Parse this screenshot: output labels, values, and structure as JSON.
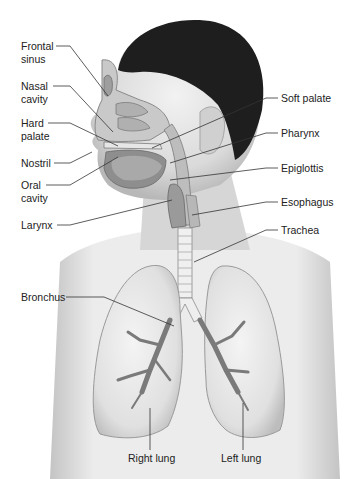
{
  "diagram": {
    "labels_left": [
      {
        "id": "frontal-sinus",
        "line1": "Frontal",
        "line2": "sinus"
      },
      {
        "id": "nasal-cavity",
        "line1": "Nasal",
        "line2": "cavity"
      },
      {
        "id": "hard-palate",
        "line1": "Hard",
        "line2": "palate"
      },
      {
        "id": "nostril",
        "line1": "Nostril",
        "line2": ""
      },
      {
        "id": "oral-cavity",
        "line1": "Oral",
        "line2": "cavity"
      },
      {
        "id": "larynx",
        "line1": "Larynx",
        "line2": ""
      },
      {
        "id": "bronchus",
        "line1": "Bronchus",
        "line2": ""
      }
    ],
    "labels_right": [
      {
        "id": "soft-palate",
        "text": "Soft palate"
      },
      {
        "id": "pharynx",
        "text": "Pharynx"
      },
      {
        "id": "epiglottis",
        "text": "Epiglottis"
      },
      {
        "id": "esophagus",
        "text": "Esophagus"
      },
      {
        "id": "trachea",
        "text": "Trachea"
      }
    ],
    "labels_bottom": [
      {
        "id": "right-lung",
        "text": "Right lung"
      },
      {
        "id": "left-lung",
        "text": "Left lung"
      }
    ],
    "colors": {
      "hair": "#1e1e1e",
      "skin": "#dcdcdc",
      "skin_shadow": "#b5b5b5",
      "lung": "#e8e8e8",
      "lung_edge": "#9a9a9a",
      "bronchi": "#7a7a7a",
      "leader_line": "#333333",
      "text": "#222222"
    }
  }
}
